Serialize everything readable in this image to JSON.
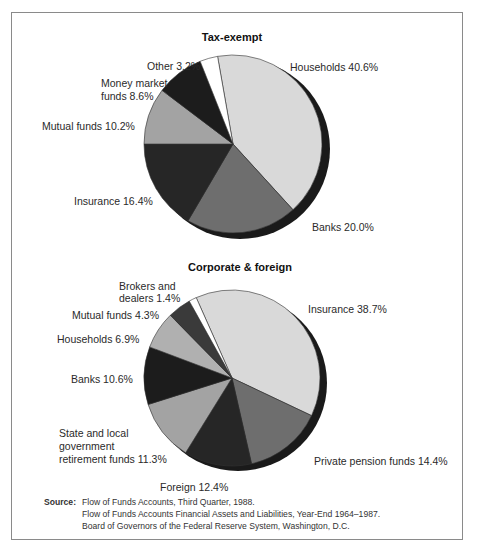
{
  "chart_data": [
    {
      "type": "pie",
      "title": "Tax-exempt",
      "categories": [
        "Households",
        "Banks",
        "Insurance",
        "Mutual funds",
        "Money market funds",
        "Other"
      ],
      "values": [
        40.6,
        20.0,
        16.4,
        10.2,
        8.6,
        3.2
      ],
      "labels": [
        "Households 40.6%",
        "Banks 20.0%",
        "Insurance 16.4%",
        "Mutual funds 10.2%",
        "Money market funds 8.6%",
        "Other 3.2%"
      ],
      "colors": [
        "#d9d9d9",
        "#6e6e6e",
        "#262626",
        "#a3a3a3",
        "#1c1c1c",
        "#ffffff"
      ]
    },
    {
      "type": "pie",
      "title": "Corporate & foreign",
      "categories": [
        "Insurance",
        "Private pension funds",
        "Foreign",
        "State and local government retirement funds",
        "Banks",
        "Households",
        "Mutual funds",
        "Brokers and dealers"
      ],
      "values": [
        38.7,
        14.4,
        12.4,
        11.3,
        10.6,
        6.9,
        4.3,
        1.4
      ],
      "labels": [
        "Insurance 38.7%",
        "Private pension funds 14.4%",
        "Foreign 12.4%",
        "State and local government retirement funds 11.3%",
        "Banks 10.6%",
        "Households 6.9%",
        "Mutual funds 4.3%",
        "Brokers and dealers 1.4%"
      ],
      "colors": [
        "#d9d9d9",
        "#6e6e6e",
        "#262626",
        "#a3a3a3",
        "#1c1c1c",
        "#b0b0b0",
        "#3a3a3a",
        "#ffffff"
      ]
    }
  ],
  "charts": {
    "top": {
      "title": "Tax-exempt",
      "labels": {
        "other": "Other 3.2%",
        "money_1": "Money market",
        "money_2": "funds 8.6%",
        "mutual": "Mutual funds 10.2%",
        "insurance": "Insurance 16.4%",
        "banks": "Banks 20.0%",
        "households": "Households 40.6%"
      }
    },
    "bottom": {
      "title": "Corporate & foreign",
      "labels": {
        "brokers_1": "Brokers and",
        "brokers_2": "dealers 1.4%",
        "mutual": "Mutual funds 4.3%",
        "households": "Households 6.9%",
        "banks": "Banks 10.6%",
        "state_1": "State and local",
        "state_2": "government",
        "state_3": "retirement funds 11.3%",
        "foreign": "Foreign 12.4%",
        "pension": "Private pension funds 14.4%",
        "insurance": "Insurance 38.7%"
      }
    }
  },
  "source": {
    "key": "Source:",
    "lines": [
      "Flow of Funds Accounts, Third Quarter, 1988.",
      "Flow of Funds Accounts Financial Assets and Liabilities, Year-End 1964–1987.",
      "Board of Governors of the Federal Reserve System, Washington, D.C."
    ]
  }
}
